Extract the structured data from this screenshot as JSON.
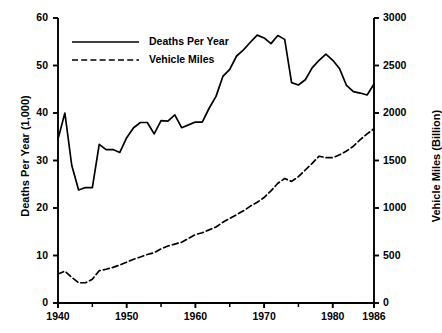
{
  "chart_data": {
    "type": "line",
    "title": "",
    "xlabel": "",
    "ylabel": "Deaths Per Year (1,000)",
    "y2label": "Vehicle Miles (Billion)",
    "grid": false,
    "legend_position": "top-left-inside",
    "xlim": [
      1940,
      1986
    ],
    "ylim": [
      0,
      60
    ],
    "y2lim": [
      0,
      3000
    ],
    "xticks": [
      1940,
      1950,
      1960,
      1970,
      1980,
      1986
    ],
    "xtick_labels": [
      "1940",
      "1950",
      "1960",
      "1970",
      "1980",
      "1986"
    ],
    "xminor_ticks": [
      1945,
      1955,
      1965,
      1975
    ],
    "yticks": [
      0,
      10,
      20,
      30,
      40,
      50,
      60
    ],
    "ytick_labels": [
      "0",
      "10",
      "20",
      "30",
      "40",
      "50",
      "60"
    ],
    "y2ticks": [
      0,
      500,
      1000,
      1500,
      2000,
      2500,
      3000
    ],
    "y2tick_labels": [
      "0",
      "500",
      "1000",
      "1500",
      "2000",
      "2500",
      "3000"
    ],
    "x": [
      1940,
      1941,
      1942,
      1943,
      1944,
      1945,
      1946,
      1947,
      1948,
      1949,
      1950,
      1951,
      1952,
      1953,
      1954,
      1955,
      1956,
      1957,
      1958,
      1959,
      1960,
      1961,
      1962,
      1963,
      1964,
      1965,
      1966,
      1967,
      1968,
      1969,
      1970,
      1971,
      1972,
      1973,
      1974,
      1975,
      1976,
      1977,
      1978,
      1979,
      1980,
      1981,
      1982,
      1983,
      1984,
      1985,
      1986
    ],
    "series": [
      {
        "name": "Deaths Per Year",
        "axis": "left",
        "style": "solid",
        "units": "thousands",
        "values": [
          34.5,
          40.0,
          29.0,
          23.8,
          24.3,
          24.3,
          33.4,
          32.3,
          32.3,
          31.7,
          34.8,
          36.9,
          38.0,
          38.0,
          35.6,
          38.4,
          38.3,
          39.6,
          36.9,
          37.5,
          38.1,
          38.1,
          41.0,
          43.5,
          47.7,
          49.2,
          52.0,
          53.3,
          54.9,
          56.4,
          55.8,
          54.6,
          56.3,
          55.5,
          46.4,
          45.9,
          47.0,
          49.5,
          51.1,
          52.4,
          51.1,
          49.3,
          45.8,
          44.5,
          44.2,
          43.8,
          46.1
        ],
        "label_left_units": "thousands of deaths"
      },
      {
        "name": "Vehicle Miles",
        "axis": "right",
        "style": "dashed",
        "units": "billions",
        "values": [
          305,
          335,
          270,
          213,
          213,
          250,
          340,
          355,
          375,
          400,
          430,
          460,
          485,
          510,
          530,
          570,
          600,
          620,
          640,
          680,
          720,
          740,
          770,
          800,
          850,
          890,
          930,
          970,
          1020,
          1060,
          1110,
          1180,
          1260,
          1310,
          1280,
          1330,
          1400,
          1470,
          1545,
          1530,
          1530,
          1560,
          1600,
          1650,
          1720,
          1780,
          1835
        ]
      }
    ],
    "legend": [
      {
        "label": "Deaths Per Year",
        "style": "solid"
      },
      {
        "label": "Vehicle Miles",
        "style": "dashed"
      }
    ],
    "plot_geometry": {
      "left_px": 58,
      "right_px": 374,
      "top_px": 18,
      "bottom_px": 303
    }
  }
}
